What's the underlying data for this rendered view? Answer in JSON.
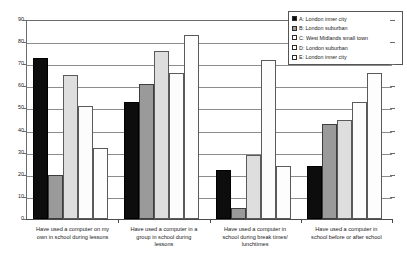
{
  "chart_data": {
    "type": "bar",
    "title": "",
    "xlabel": "",
    "ylabel": "",
    "ylim": [
      0,
      90
    ],
    "ytick_step": 10,
    "yticks": [
      0,
      10,
      20,
      30,
      40,
      50,
      60,
      70,
      80,
      90
    ],
    "grid": true,
    "legend_position": "top-right",
    "categories": [
      "Have used a computer on my own in school during lessons",
      "Have used a computer in a group in school during lessons",
      "Have used a computer in school during break times/ lunchtimes",
      "Have used a computer in school before or after school"
    ],
    "series": [
      {
        "name": "A: London inner city",
        "key": "a",
        "color": "#0d0d0d",
        "values": [
          73,
          53,
          22,
          24
        ]
      },
      {
        "name": "B: London suburban",
        "key": "b",
        "color": "#9a9a9a",
        "values": [
          20,
          61,
          5,
          43
        ]
      },
      {
        "name": "C: West Midlands small town",
        "key": "c",
        "color": "#dedede",
        "values": [
          65,
          76,
          29,
          45
        ]
      },
      {
        "name": "D: London suburban",
        "key": "d",
        "color": "#fcfcfc",
        "values": [
          51,
          66,
          72,
          53
        ]
      },
      {
        "name": "E: London inner city",
        "key": "e",
        "color": "#fdfdfd",
        "values": [
          32,
          83,
          24,
          66
        ]
      }
    ]
  },
  "axis": {
    "y_tick_labels": [
      "90",
      "80",
      "70",
      "60",
      "50",
      "40",
      "30",
      "20",
      "10",
      "0"
    ]
  },
  "legend": {
    "items": [
      {
        "label": "A: London inner city"
      },
      {
        "label": "B: London suburban"
      },
      {
        "label": "C: West Midlands small town"
      },
      {
        "label": "D: London suburban"
      },
      {
        "label": "E: London inner city"
      }
    ]
  },
  "x_labels": [
    {
      "line1": "Have used a computer on my",
      "line2": "own in school during lessons",
      "line3": ""
    },
    {
      "line1": "Have used a computer in a",
      "line2": "group in school during",
      "line3": "lessons"
    },
    {
      "line1": "Have used a computer in",
      "line2": "school during break times/",
      "line3": "lunchtimes"
    },
    {
      "line1": "Have used a computer in",
      "line2": "school before or after school",
      "line3": ""
    }
  ]
}
